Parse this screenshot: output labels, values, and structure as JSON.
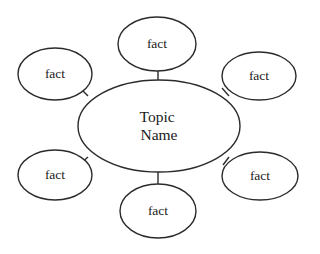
{
  "diagram": {
    "type": "concept-web",
    "background_color": "#ffffff",
    "stroke_color": "#2b2b2b",
    "fill_color": "#ffffff",
    "text_color": "#1a1a1a",
    "stroke_width": 1.4,
    "center": {
      "label_line_1": "Topic",
      "label_line_2": "Name",
      "cx": 159,
      "cy": 126,
      "rx": 81,
      "ry": 46
    },
    "nodes": [
      {
        "id": "fact-top",
        "label": "fact",
        "cx": 157,
        "cy": 44,
        "rx": 39,
        "ry": 27
      },
      {
        "id": "fact-upper-right",
        "label": "fact",
        "cx": 259,
        "cy": 76,
        "rx": 37,
        "ry": 24
      },
      {
        "id": "fact-lower-right",
        "label": "fact",
        "cx": 260,
        "cy": 176,
        "rx": 38,
        "ry": 24
      },
      {
        "id": "fact-bottom",
        "label": "fact",
        "cx": 158,
        "cy": 211,
        "rx": 38,
        "ry": 27
      },
      {
        "id": "fact-lower-left",
        "label": "fact",
        "cx": 55,
        "cy": 175,
        "rx": 37,
        "ry": 25
      },
      {
        "id": "fact-upper-left",
        "label": "fact",
        "cx": 55,
        "cy": 74,
        "rx": 37,
        "ry": 26
      }
    ],
    "connectors": [
      {
        "id": "connector-top",
        "from": "center",
        "to": "fact-top",
        "x1": 158,
        "y1": 80,
        "x2": 158,
        "y2": 71
      },
      {
        "id": "connector-upper-right",
        "from": "center",
        "to": "fact-upper-right",
        "x1": 229,
        "y1": 96,
        "x2": 222,
        "y2": 88
      },
      {
        "id": "connector-lower-right",
        "from": "center",
        "to": "fact-lower-right",
        "x1": 229,
        "y1": 157,
        "x2": 223,
        "y2": 165
      },
      {
        "id": "connector-bottom",
        "from": "center",
        "to": "fact-bottom",
        "x1": 158,
        "y1": 172,
        "x2": 158,
        "y2": 185
      },
      {
        "id": "connector-lower-left",
        "from": "center",
        "to": "fact-lower-left",
        "x1": 88,
        "y1": 157,
        "x2": 80,
        "y2": 164
      },
      {
        "id": "connector-upper-left",
        "from": "center",
        "to": "fact-upper-left",
        "x1": 88,
        "y1": 96,
        "x2": 80,
        "y2": 88
      }
    ]
  }
}
